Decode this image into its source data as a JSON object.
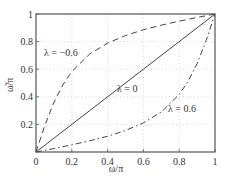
{
  "chart_data": {
    "type": "line",
    "title": "",
    "xlabel": "ω/π",
    "ylabel": "ω̃/π",
    "xlim": [
      0,
      1
    ],
    "ylim": [
      0,
      1
    ],
    "grid": true,
    "xticks": [
      "0",
      "0.2",
      "0.4",
      "0.6",
      "0.8",
      "1"
    ],
    "yticks": [
      "0.2",
      "0.4",
      "0.6",
      "0.8",
      "1"
    ],
    "series": [
      {
        "name": "λ = −0.6",
        "style": "dashed",
        "x": [
          0,
          0.05,
          0.1,
          0.15,
          0.2,
          0.3,
          0.4,
          0.5,
          0.6,
          0.7,
          0.8,
          0.9,
          1
        ],
        "y": [
          0,
          0.194,
          0.36,
          0.487,
          0.583,
          0.71,
          0.789,
          0.844,
          0.886,
          0.919,
          0.948,
          0.975,
          1
        ]
      },
      {
        "name": "λ = 0",
        "style": "solid",
        "x": [
          0,
          1
        ],
        "y": [
          0,
          1
        ]
      },
      {
        "name": "λ = 0.6",
        "style": "dashdot",
        "x": [
          0,
          0.1,
          0.2,
          0.3,
          0.4,
          0.5,
          0.6,
          0.7,
          0.8,
          0.85,
          0.9,
          0.95,
          1
        ],
        "y": [
          0,
          0.025,
          0.052,
          0.081,
          0.114,
          0.156,
          0.211,
          0.29,
          0.417,
          0.513,
          0.64,
          0.806,
          1
        ]
      }
    ],
    "annotations": [
      {
        "text": "λ = −0.6",
        "x": 0.06,
        "y": 0.72
      },
      {
        "text": "λ = 0",
        "x": 0.45,
        "y": 0.42
      },
      {
        "text": "λ = 0.6",
        "x": 0.7,
        "y": 0.24
      }
    ]
  },
  "labels": {
    "xlabel": "ω/π",
    "ylabel": "ω̃/π",
    "ann_neg": "λ = −0.6",
    "ann_zero": "λ = 0",
    "ann_pos": "λ = 0.6"
  }
}
